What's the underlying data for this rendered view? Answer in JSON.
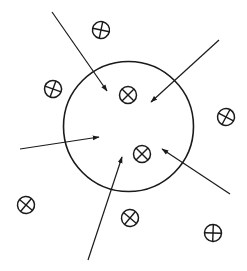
{
  "diagram": {
    "stroke_color": "#1a1a1a",
    "background": "#ffffff",
    "boundary": {
      "shape": "circle",
      "cx": 128.5,
      "cy": 126.5,
      "r": 65
    },
    "particles": [
      {
        "id": "inner-1",
        "cx": 128,
        "cy": 95,
        "r": 8.5,
        "symbol": "otimes",
        "rotation": 45,
        "location": "inside"
      },
      {
        "id": "inner-2",
        "cx": 142,
        "cy": 154,
        "r": 8.5,
        "symbol": "otimes",
        "rotation": 45,
        "location": "inside"
      },
      {
        "id": "outer-1",
        "cx": 101,
        "cy": 30,
        "r": 8.5,
        "symbol": "oplus",
        "rotation": 12,
        "location": "outside"
      },
      {
        "id": "outer-2",
        "cx": 53,
        "cy": 89,
        "r": 8.5,
        "symbol": "oplus",
        "rotation": 20,
        "location": "outside"
      },
      {
        "id": "outer-3",
        "cx": 226,
        "cy": 117,
        "r": 8.5,
        "symbol": "oplus",
        "rotation": 28,
        "location": "outside"
      },
      {
        "id": "outer-4",
        "cx": 26,
        "cy": 205,
        "r": 8.5,
        "symbol": "otimes",
        "rotation": 40,
        "location": "outside"
      },
      {
        "id": "outer-5",
        "cx": 130,
        "cy": 218,
        "r": 8.5,
        "symbol": "otimes",
        "rotation": 40,
        "location": "outside"
      },
      {
        "id": "outer-6",
        "cx": 213,
        "cy": 233,
        "r": 8.5,
        "symbol": "oplus",
        "rotation": 2,
        "location": "outside"
      }
    ],
    "arrows": [
      {
        "id": "arrow-top-left",
        "x1": 52,
        "y1": 12,
        "x2": 107,
        "y2": 91
      },
      {
        "id": "arrow-top-right",
        "x1": 219,
        "y1": 40,
        "x2": 151,
        "y2": 102
      },
      {
        "id": "arrow-left",
        "x1": 20,
        "y1": 149,
        "x2": 99,
        "y2": 137
      },
      {
        "id": "arrow-bottom",
        "x1": 88,
        "y1": 260,
        "x2": 122,
        "y2": 157
      },
      {
        "id": "arrow-bottom-right",
        "x1": 230,
        "y1": 194,
        "x2": 162,
        "y2": 149
      }
    ]
  }
}
